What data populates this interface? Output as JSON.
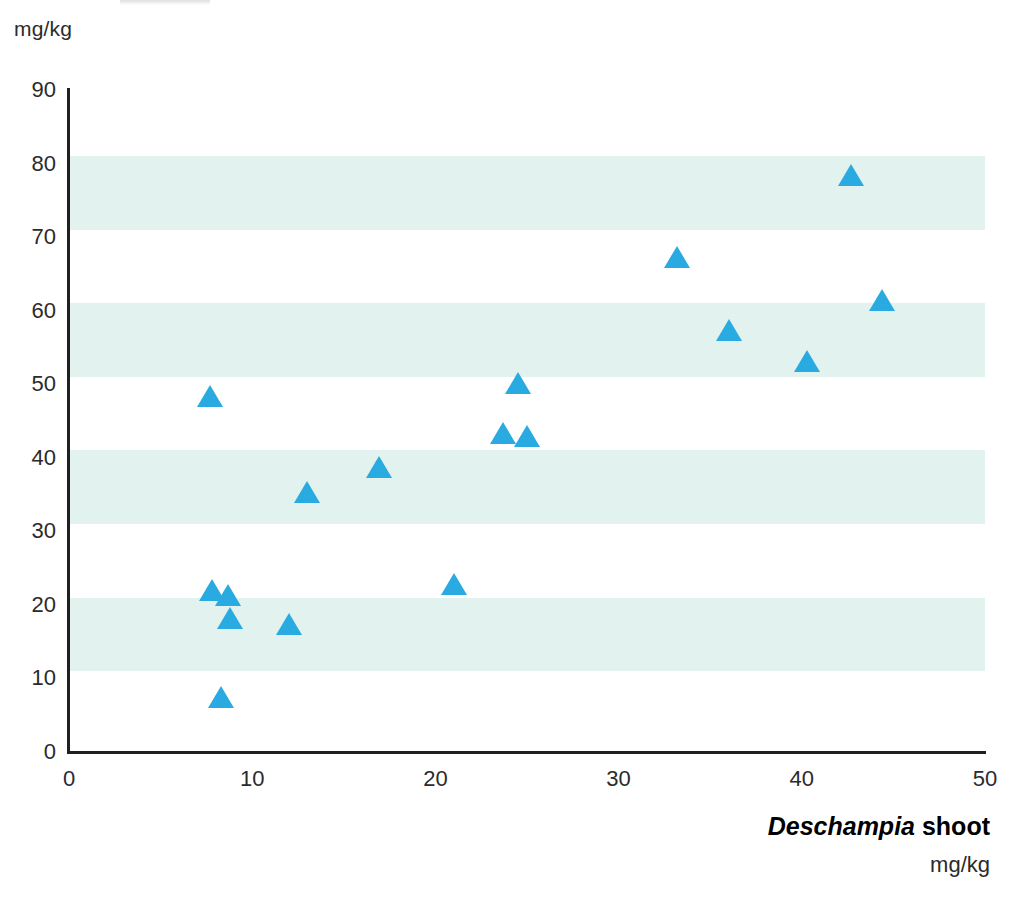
{
  "chart_data": {
    "type": "scatter",
    "title": "",
    "xlabel": "Deschampia shoot",
    "xlabel_genus": "Deschampia",
    "xlabel_rest": " shoot",
    "xlabel_unit": "mg/kg",
    "ylabel": "",
    "ylabel_unit": "mg/kg",
    "xlim": [
      0,
      50
    ],
    "ylim": [
      0,
      90
    ],
    "xticks": [
      0,
      10,
      20,
      30,
      40,
      50
    ],
    "yticks": [
      0,
      10,
      20,
      30,
      40,
      50,
      60,
      70,
      80,
      90
    ],
    "xtick_labels": [
      "0",
      "10",
      "20",
      "30",
      "40",
      "50"
    ],
    "ytick_labels": [
      "0",
      "10",
      "20",
      "30",
      "40",
      "50",
      "60",
      "70",
      "80",
      "90"
    ],
    "grid": false,
    "banding": {
      "color": "#e2f2ef",
      "ranges": [
        [
          11,
          21
        ],
        [
          31,
          41
        ],
        [
          51,
          61
        ],
        [
          71,
          81
        ]
      ]
    },
    "legend": null,
    "marker": {
      "shape": "triangle-up",
      "color": "#29abe2",
      "size": 26
    },
    "series": [
      {
        "name": "Deschampia shoot vs tissue",
        "points": [
          {
            "x": 7.7,
            "y": 48.4
          },
          {
            "x": 7.8,
            "y": 22.0
          },
          {
            "x": 8.7,
            "y": 21.4
          },
          {
            "x": 8.8,
            "y": 18.2
          },
          {
            "x": 8.3,
            "y": 7.5
          },
          {
            "x": 12.0,
            "y": 17.4
          },
          {
            "x": 13.0,
            "y": 35.4
          },
          {
            "x": 16.9,
            "y": 38.7
          },
          {
            "x": 21.0,
            "y": 22.8
          },
          {
            "x": 23.7,
            "y": 43.4
          },
          {
            "x": 24.5,
            "y": 50.2
          },
          {
            "x": 25.0,
            "y": 43.0
          },
          {
            "x": 33.2,
            "y": 67.3
          },
          {
            "x": 36.0,
            "y": 57.4
          },
          {
            "x": 40.3,
            "y": 53.2
          },
          {
            "x": 42.7,
            "y": 78.4
          },
          {
            "x": 44.4,
            "y": 61.4
          }
        ]
      }
    ]
  },
  "axes": {
    "y_unit_top_label": "mg/kg",
    "axis_line_color": "#231f20"
  }
}
